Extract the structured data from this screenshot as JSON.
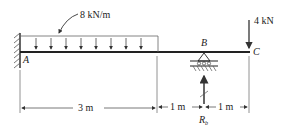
{
  "diagram": {
    "type": "beam-free-body",
    "distributed_load": {
      "label": "8 kN/m",
      "from": "A",
      "length_m": 3
    },
    "point_load": {
      "label": "4 kN",
      "at": "C"
    },
    "points": {
      "A": "A",
      "B": "B",
      "C": "C"
    },
    "support_A": "fixed",
    "support_B": "roller/pin",
    "reaction_label": "R",
    "reaction_sub": "b",
    "dimensions": [
      {
        "label": "3 m"
      },
      {
        "label": "1 m"
      },
      {
        "label": "1 m"
      }
    ]
  }
}
